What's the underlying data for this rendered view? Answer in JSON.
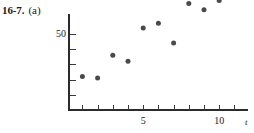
{
  "figure": {
    "number": "16-7.",
    "part": "(a)"
  },
  "chart_data": {
    "type": "scatter",
    "title": "",
    "subtitle": "",
    "xlabel": "t",
    "ylabel": "",
    "x": [
      1,
      2,
      3,
      4,
      5,
      6,
      7,
      8,
      9,
      10
    ],
    "y": [
      22,
      21,
      36,
      32,
      54,
      57,
      44,
      70,
      66,
      72
    ],
    "xlim": [
      0,
      11.9
    ],
    "ylim": [
      0,
      75
    ],
    "x_ticks": [
      1,
      2,
      3,
      4,
      5,
      6,
      7,
      8,
      9,
      10,
      11
    ],
    "x_tick_labels": [
      {
        "value": 5,
        "label": "5"
      },
      {
        "value": 10,
        "label": "10"
      }
    ],
    "y_ticks": [
      10,
      20,
      30,
      40,
      50
    ],
    "y_tick_labels": [
      {
        "value": 50,
        "label": "50"
      }
    ],
    "grid": false,
    "legend": null,
    "marker": "filled-circle",
    "marker_color": "#4a4a4a",
    "axis_color": "#2b2b2b",
    "annotations": []
  }
}
